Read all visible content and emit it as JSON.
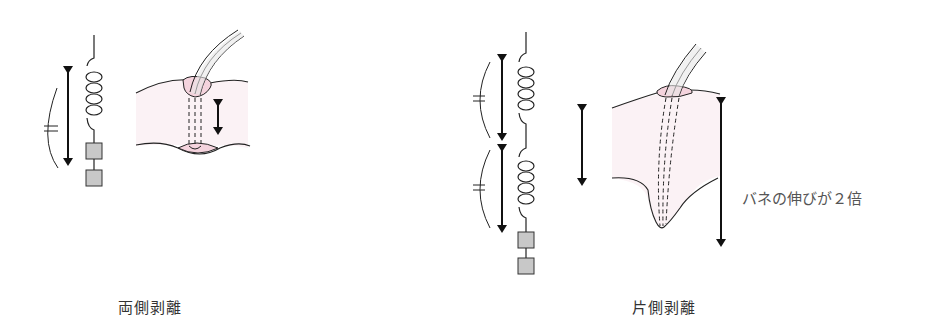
{
  "left_panel": {
    "caption": "両側剥離"
  },
  "right_panel": {
    "caption": "片側剥離",
    "annotation": "バネの伸びが２倍"
  },
  "colors": {
    "line": "#1a1a1a",
    "tissue_fill": "#fbf2f5",
    "pink_fill": "#f4d3dd",
    "block_fill": "#c8c8c8",
    "tube_fill": "#e8e8e8"
  }
}
